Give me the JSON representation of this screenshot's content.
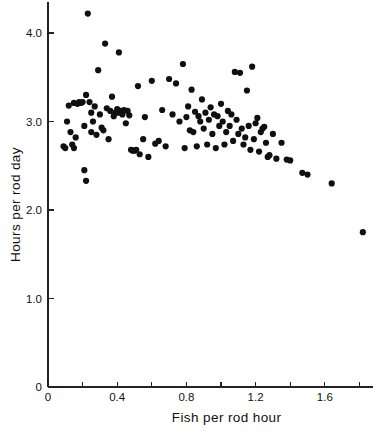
{
  "chart_data": {
    "type": "scatter",
    "title": "",
    "xlabel": "Fish per rod hour",
    "ylabel": "Hours per rod day",
    "xlim": [
      0,
      1.88
    ],
    "ylim": [
      0,
      4.35
    ],
    "grid": false,
    "legend": null,
    "x_ticks_major": [
      "0",
      "0.4",
      "0.8",
      "1.2",
      "1.6"
    ],
    "x_tick_values_major": [
      0,
      0.4,
      0.8,
      1.2,
      1.6
    ],
    "x_tick_values_minor": [
      0.2,
      0.6,
      1.0,
      1.4,
      1.8
    ],
    "y_ticks_major": [
      "0",
      "1.0",
      "2.0",
      "3.0",
      "4.0"
    ],
    "y_tick_values_major": [
      0,
      1.0,
      2.0,
      3.0,
      4.0
    ],
    "marker": "filled-circle",
    "marker_color": "#101010",
    "marker_size_px": 3.1,
    "points": [
      [
        0.09,
        2.72
      ],
      [
        0.1,
        2.7
      ],
      [
        0.11,
        3.0
      ],
      [
        0.12,
        3.18
      ],
      [
        0.13,
        2.88
      ],
      [
        0.14,
        2.74
      ],
      [
        0.15,
        2.7
      ],
      [
        0.15,
        3.21
      ],
      [
        0.16,
        2.82
      ],
      [
        0.17,
        3.2
      ],
      [
        0.18,
        3.22
      ],
      [
        0.19,
        3.21
      ],
      [
        0.2,
        3.22
      ],
      [
        0.21,
        2.95
      ],
      [
        0.21,
        2.45
      ],
      [
        0.22,
        3.3
      ],
      [
        0.22,
        2.33
      ],
      [
        0.23,
        4.22
      ],
      [
        0.24,
        3.22
      ],
      [
        0.25,
        3.1
      ],
      [
        0.25,
        2.88
      ],
      [
        0.26,
        3.0
      ],
      [
        0.27,
        3.17
      ],
      [
        0.28,
        2.85
      ],
      [
        0.29,
        3.58
      ],
      [
        0.3,
        3.08
      ],
      [
        0.31,
        2.93
      ],
      [
        0.32,
        2.9
      ],
      [
        0.33,
        3.88
      ],
      [
        0.34,
        3.15
      ],
      [
        0.35,
        2.8
      ],
      [
        0.36,
        3.12
      ],
      [
        0.37,
        3.28
      ],
      [
        0.38,
        3.06
      ],
      [
        0.39,
        3.1
      ],
      [
        0.4,
        3.14
      ],
      [
        0.41,
        3.78
      ],
      [
        0.41,
        3.1
      ],
      [
        0.42,
        3.12
      ],
      [
        0.43,
        3.08
      ],
      [
        0.44,
        3.13
      ],
      [
        0.45,
        2.98
      ],
      [
        0.46,
        3.12
      ],
      [
        0.47,
        3.07
      ],
      [
        0.48,
        2.68
      ],
      [
        0.49,
        2.67
      ],
      [
        0.5,
        2.67
      ],
      [
        0.51,
        2.68
      ],
      [
        0.52,
        3.4
      ],
      [
        0.53,
        2.63
      ],
      [
        0.55,
        2.8
      ],
      [
        0.56,
        3.05
      ],
      [
        0.58,
        2.6
      ],
      [
        0.6,
        3.46
      ],
      [
        0.62,
        2.75
      ],
      [
        0.64,
        2.78
      ],
      [
        0.66,
        3.13
      ],
      [
        0.68,
        2.72
      ],
      [
        0.7,
        3.48
      ],
      [
        0.72,
        3.08
      ],
      [
        0.74,
        3.43
      ],
      [
        0.76,
        3.0
      ],
      [
        0.78,
        3.65
      ],
      [
        0.79,
        2.7
      ],
      [
        0.8,
        3.05
      ],
      [
        0.81,
        3.17
      ],
      [
        0.82,
        2.9
      ],
      [
        0.83,
        3.36
      ],
      [
        0.84,
        2.88
      ],
      [
        0.85,
        3.11
      ],
      [
        0.86,
        2.72
      ],
      [
        0.87,
        3.06
      ],
      [
        0.88,
        3.0
      ],
      [
        0.89,
        3.25
      ],
      [
        0.9,
        2.92
      ],
      [
        0.91,
        3.1
      ],
      [
        0.92,
        2.74
      ],
      [
        0.93,
        3.02
      ],
      [
        0.94,
        3.16
      ],
      [
        0.95,
        2.86
      ],
      [
        0.96,
        3.08
      ],
      [
        0.97,
        2.7
      ],
      [
        0.98,
        3.06
      ],
      [
        0.99,
        2.95
      ],
      [
        1.0,
        3.2
      ],
      [
        1.01,
        3.0
      ],
      [
        1.02,
        2.74
      ],
      [
        1.03,
        2.88
      ],
      [
        1.04,
        3.12
      ],
      [
        1.05,
        2.95
      ],
      [
        1.06,
        3.08
      ],
      [
        1.07,
        2.78
      ],
      [
        1.08,
        3.56
      ],
      [
        1.09,
        3.02
      ],
      [
        1.1,
        2.86
      ],
      [
        1.11,
        3.55
      ],
      [
        1.12,
        2.92
      ],
      [
        1.13,
        2.74
      ],
      [
        1.14,
        2.82
      ],
      [
        1.15,
        3.35
      ],
      [
        1.16,
        2.95
      ],
      [
        1.17,
        2.68
      ],
      [
        1.18,
        3.62
      ],
      [
        1.19,
        2.8
      ],
      [
        1.2,
        2.98
      ],
      [
        1.21,
        3.04
      ],
      [
        1.22,
        2.66
      ],
      [
        1.23,
        2.88
      ],
      [
        1.24,
        2.92
      ],
      [
        1.25,
        2.94
      ],
      [
        1.26,
        2.76
      ],
      [
        1.27,
        2.6
      ],
      [
        1.28,
        2.62
      ],
      [
        1.3,
        2.86
      ],
      [
        1.32,
        2.58
      ],
      [
        1.35,
        2.76
      ],
      [
        1.38,
        2.57
      ],
      [
        1.4,
        2.56
      ],
      [
        1.47,
        2.42
      ],
      [
        1.5,
        2.4
      ],
      [
        1.64,
        2.3
      ],
      [
        1.82,
        1.75
      ]
    ]
  }
}
